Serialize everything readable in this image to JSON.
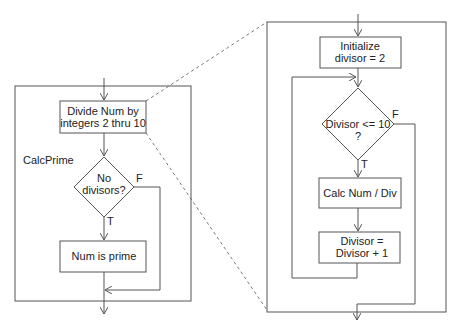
{
  "diagram": {
    "type": "flowchart",
    "left": {
      "title": "CalcPrime",
      "steps": {
        "divide": [
          "Divide Num by",
          "integers 2 thru 10"
        ],
        "decision": [
          "No",
          "divisors?"
        ],
        "prime": "Num is prime"
      },
      "labels": {
        "true": "T",
        "false": "F"
      }
    },
    "right": {
      "steps": {
        "init": [
          "Initialize",
          "divisor = 2"
        ],
        "decision": [
          "Divisor <= 10",
          "?"
        ],
        "calc": "Calc Num / Div",
        "increment": [
          "Divisor =",
          "Divisor + 1"
        ]
      },
      "labels": {
        "true": "T",
        "false": "F"
      }
    }
  }
}
